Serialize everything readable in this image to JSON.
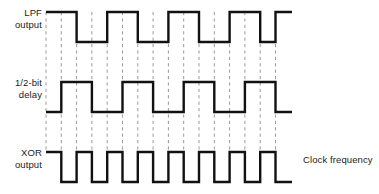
{
  "figure": {
    "title": "",
    "background_color": "#ffffff",
    "waveform_color": "#111111",
    "gridline_color": "#9a9a9a",
    "text_color": "#1b1b1b",
    "width": 379,
    "height": 194
  },
  "labels": {
    "lpf_line1": "LPF",
    "lpf_line2": "output",
    "delay_line1": "1/2-bit",
    "delay_line2": "delay",
    "xor_line1": "XOR",
    "xor_line2": "output",
    "clock_note": "Clock frequency"
  },
  "chart_data": {
    "type": "line",
    "xlabel": "",
    "ylabel": "",
    "grid": true,
    "legend_position": "none",
    "x_start": 46,
    "x_end": 292,
    "bit_period": 30.6,
    "half_bit": 15.3,
    "gridline_x": [
      46,
      61.3,
      76.6,
      91.9,
      107.2,
      122.5,
      137.8,
      153.1,
      168.4,
      183.7,
      199,
      214.3,
      229.6,
      244.9,
      260.2,
      275.5
    ],
    "gridline_y_top": 12,
    "gridline_y_bottom": 152,
    "series": [
      {
        "name": "LPF output",
        "row": 0,
        "y_high": 12,
        "y_low": 42,
        "initial_level": "high",
        "transitions": [
          46,
          76.6,
          107.2,
          137.8,
          168.4,
          199,
          229.6,
          260.2,
          275.5
        ],
        "note": "square wave, period 61.2 px, starts high at x=46, ends low at x=292"
      },
      {
        "name": "1/2-bit delay",
        "row": 1,
        "y_high": 82,
        "y_low": 112,
        "initial_level": "low",
        "transitions": [
          46,
          61.3,
          91.9,
          122.5,
          153.1,
          183.7,
          214.3,
          244.9,
          275.5
        ],
        "note": "same square wave delayed by half a bit (15.3 px), ends high at x=292"
      },
      {
        "name": "XOR output",
        "row": 2,
        "y_high": 152,
        "y_low": 182,
        "initial_level": "high",
        "transitions": [
          46,
          61.3,
          76.6,
          91.9,
          107.2,
          122.5,
          137.8,
          153.1,
          168.4,
          183.7,
          199,
          214.3,
          229.6,
          244.9,
          260.2,
          275.5
        ],
        "note": "double-frequency square wave equal to clock frequency, period 30.6 px"
      }
    ]
  }
}
